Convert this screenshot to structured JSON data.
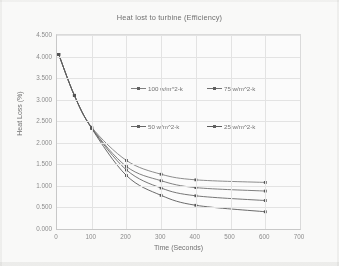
{
  "chart_data": {
    "type": "line",
    "title": "Heat lost to turbine (Efficiency)",
    "xlabel": "Time (Seconds)",
    "ylabel": "Heat Loss (%)",
    "xlim": [
      0,
      700
    ],
    "ylim": [
      0,
      4.5
    ],
    "xticks": [
      "0",
      "100",
      "200",
      "300",
      "400",
      "500",
      "600",
      "700"
    ],
    "yticks": [
      "0.000",
      "0.500",
      "1.000",
      "1.500",
      "2.000",
      "2.500",
      "3.000",
      "3.500",
      "4.000",
      "4.500"
    ],
    "grid": true,
    "legend_position": "inside-upper-center",
    "x": [
      5,
      50,
      100,
      200,
      300,
      400,
      600
    ],
    "series": [
      {
        "name": "100 w/m^2-k",
        "color": "#7d7d7d",
        "values": [
          4.05,
          3.1,
          2.36,
          1.59,
          1.27,
          1.14,
          1.08
        ]
      },
      {
        "name": "75 w/m^2-k",
        "color": "#6e6e6e",
        "values": [
          4.05,
          3.1,
          2.35,
          1.45,
          1.12,
          0.96,
          0.88
        ]
      },
      {
        "name": "50 w/m^2-k",
        "color": "#636363",
        "values": [
          4.05,
          3.1,
          2.34,
          1.37,
          0.95,
          0.77,
          0.66
        ]
      },
      {
        "name": "25 w/m^2-k",
        "color": "#565656",
        "values": [
          4.05,
          3.1,
          2.33,
          1.24,
          0.78,
          0.55,
          0.4
        ]
      }
    ]
  }
}
